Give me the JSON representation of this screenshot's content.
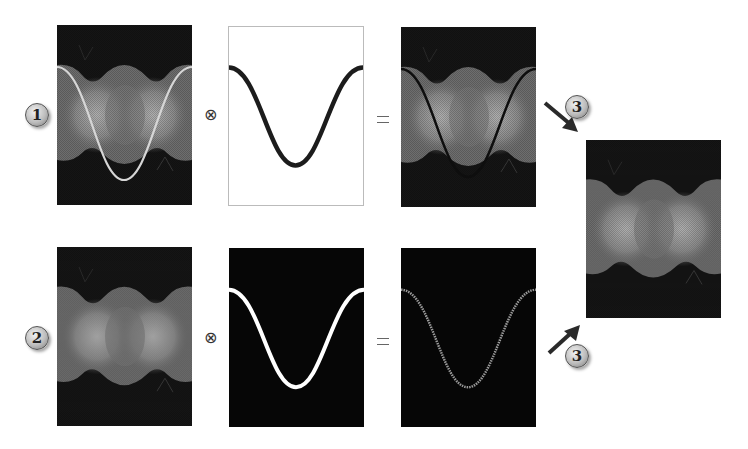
{
  "diagram": {
    "rows": [
      {
        "badge": "1",
        "operator_multiply": "⊗",
        "operator_equals": "=",
        "panels": [
          {
            "name": "input-image-with-white-curve",
            "background": "#1a1a1a",
            "curve_color": "#d8d8d8"
          },
          {
            "name": "mask-black-curve-on-white",
            "background": "#ffffff",
            "curve_color": "#1a1a1a"
          },
          {
            "name": "result-image-with-dark-curve",
            "background": "#1a1a1a",
            "curve_color": "#111111"
          }
        ]
      },
      {
        "badge": "2",
        "operator_multiply": "⊗",
        "operator_equals": "=",
        "panels": [
          {
            "name": "input-image-plain",
            "background": "#1a1a1a"
          },
          {
            "name": "mask-white-curve-on-black",
            "background": "#050505",
            "curve_color": "#ffffff"
          },
          {
            "name": "result-curve-only",
            "background": "#050505",
            "curve_color": "#9a9a9a"
          }
        ]
      }
    ],
    "combine": {
      "badge_top": "3",
      "badge_bottom": "3",
      "output_panel": "combined-result-image"
    },
    "colors": {
      "dark_bg": "#141414",
      "mid_gray": "#7d7d7d",
      "light_gray": "#a8a8a8",
      "arrow": "#2a2a2a"
    }
  }
}
